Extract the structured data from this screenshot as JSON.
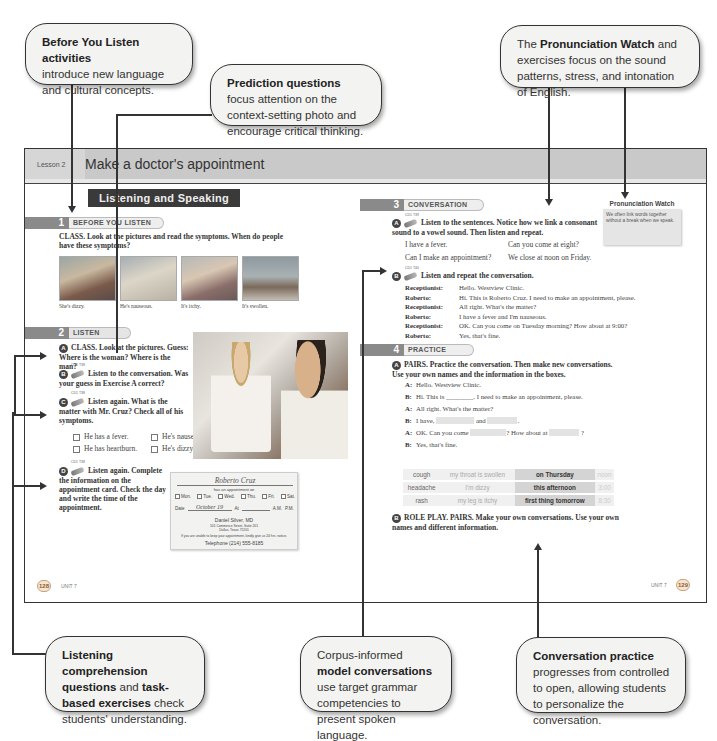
{
  "callouts": {
    "before_you_listen": {
      "bold": "Before You Listen activities",
      "rest": "introduce new language and cultural concepts."
    },
    "prediction": {
      "bold": "Prediction questions",
      "rest": "focus attention on the context-setting photo and encourage critical thinking."
    },
    "pronunciation": {
      "pre": "The",
      "bold": "Pronunciation Watch",
      "rest": "and exercises focus on the sound patterns, stress, and intonation of English."
    },
    "listening": {
      "bold1": "Listening comprehension questions",
      "mid": "and",
      "bold2": "task-based exercises",
      "rest": "check students' understanding."
    },
    "corpus": {
      "pre": "Corpus-informed",
      "bold": "model conversations",
      "rest": "use target grammar competencies to present spoken language."
    },
    "conversation_practice": {
      "bold": "Conversation practice",
      "rest": "progresses from controlled to open, allowing students to personalize the conversation."
    }
  },
  "lesson": {
    "label": "Lesson 2",
    "title": "Make a doctor's appointment",
    "banner": "Listening and Speaking"
  },
  "section1": {
    "num": "1",
    "label": "BEFORE YOU LISTEN",
    "instruction": "CLASS. Look at the pictures and read the symptoms. When do people have these symptoms?",
    "pictures": [
      {
        "caption": "She's dizzy."
      },
      {
        "caption": "He's nauseous."
      },
      {
        "caption": "It's itchy."
      },
      {
        "caption": "It's swollen."
      }
    ]
  },
  "section2": {
    "num": "2",
    "label": "LISTEN",
    "a": {
      "badge": "A",
      "text": "CLASS. Look at the pictures. Guess: Where is the woman? Where is the man?"
    },
    "b": {
      "badge": "B",
      "cd": "CD1 T38",
      "text": "Listen to the conversation. Was your guess in Exercise A correct?"
    },
    "c": {
      "badge": "C",
      "cd": "CD1 T38",
      "text": "Listen again. What is the matter with Mr. Cruz? Check all of his symptoms."
    },
    "checks": [
      "He has a fever.",
      "He's nauseous.",
      "He has heartburn.",
      "He's dizzy."
    ],
    "d": {
      "badge": "D",
      "cd": "CD1 T38",
      "text": "Listen again. Complete the information on the appointment card. Check the day and write the time of the appointment."
    }
  },
  "appointment_card": {
    "name": "Roberto Cruz",
    "has_appt": "has an appointment on",
    "days": [
      "Mon.",
      "Tue.",
      "Wed.",
      "Thu.",
      "Fri.",
      "Sat."
    ],
    "date_label": "Date",
    "date_value": "October 19",
    "at_label": "At",
    "am": "A.M.",
    "pm": "P.M.",
    "doctor": "Daniel Silver, MD",
    "address1": "101 Commerce Street, Suite 201",
    "address2": "Dallas, Texas 75201",
    "notice": "If you are unable to keep your appointment, kindly give us 24 hrs. notice.",
    "phone": "Telephone (214) 555-8185"
  },
  "section3": {
    "num": "3",
    "label": "CONVERSATION",
    "a": {
      "badge": "A",
      "cd": "CD1 T39",
      "text": "Listen to the sentences. Notice how we link a consonant sound to a vowel sound. Then listen and repeat."
    },
    "linked": [
      "I have a fever.",
      "Can you come at eight?",
      "Can I make an appointment?",
      "We close at noon on Friday."
    ],
    "b": {
      "badge": "B",
      "cd": "CD1 T40",
      "text": "Listen and repeat the conversation."
    },
    "dialog": [
      {
        "speaker": "Receptionist:",
        "line": "Hello. Westview Clinic."
      },
      {
        "speaker": "Roberto:",
        "line": "Hi. This is Roberto Cruz. I need to make an appointment, please."
      },
      {
        "speaker": "Receptionist:",
        "line": "All right. What's the matter?"
      },
      {
        "speaker": "Roberto:",
        "line": "I have a fever and I'm nauseous."
      },
      {
        "speaker": "Receptionist:",
        "line": "OK. Can you come on Tuesday morning? How about at 9:00?"
      },
      {
        "speaker": "Roberto:",
        "line": "Yes, that's fine."
      }
    ]
  },
  "pronunciation_watch": {
    "title": "Pronunciation Watch",
    "text": "We often link words together without a break when we speak."
  },
  "section4": {
    "num": "4",
    "label": "PRACTICE",
    "a": {
      "badge": "A",
      "text": "PAIRS. Practice the conversation. Then make new conversations. Use your own names and the information in the boxes."
    },
    "lines": [
      {
        "who": "A:",
        "text": "Hello. Westview Clinic."
      },
      {
        "who": "B:",
        "pre": "Hi. This is",
        "blank": "________",
        "post": ". I need to make an appointment, please."
      },
      {
        "who": "A:",
        "text": "All right. What's the matter?"
      },
      {
        "who": "B:",
        "pre": "I have,",
        "mid": "and",
        "post": "."
      },
      {
        "who": "A:",
        "pre": "OK. Can you come",
        "mid": "? How about at",
        "post": "?"
      },
      {
        "who": "B:",
        "text": "Yes, that's fine."
      }
    ],
    "table": [
      [
        "cough",
        "my throat is swollen",
        "on Thursday",
        "noon"
      ],
      [
        "headache",
        "I'm dizzy",
        "this afternoon",
        "3:00"
      ],
      [
        "rash",
        "my leg is itchy",
        "first thing tomorrow",
        "8:30"
      ]
    ],
    "b": {
      "badge": "B",
      "text": "ROLE PLAY. PAIRS. Make your own conversations. Use your own names and different information."
    }
  },
  "footer": {
    "left_page": "128",
    "left_unit": "UNIT 7",
    "right_page": "129",
    "right_unit": "UNIT 7"
  }
}
